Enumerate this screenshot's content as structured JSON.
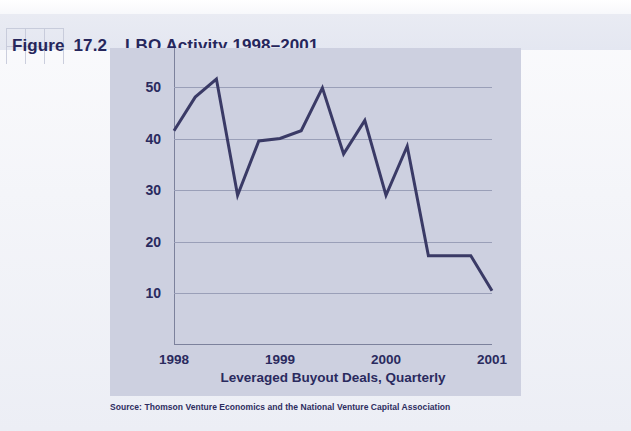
{
  "figure": {
    "label": "Figure",
    "number": "17.2",
    "title": "LBO Activity 1998–2001",
    "source_note": "Source: Thomson Venture Economics and the National Venture Capital Association"
  },
  "colors": {
    "page_background": "#f4f5f9",
    "title_band": "#e7e9f2",
    "panel_background": "#cdd0e0",
    "series_line": "#3a3a66",
    "grid_line": "#9a9fb8",
    "axis_line": "#7c819c",
    "text": "#2a2a5e"
  },
  "chart_data": {
    "type": "line",
    "title": "LBO Activity 1998–2001",
    "xlabel": "Leveraged Buyout Deals, Quarterly",
    "ylabel": "",
    "xlim": [
      0,
      15
    ],
    "ylim": [
      0,
      55
    ],
    "grid": true,
    "legend": null,
    "y_ticks": [
      10,
      20,
      30,
      40,
      50
    ],
    "y_tick_labels": [
      "10",
      "20",
      "30",
      "40",
      "50"
    ],
    "x_ticks": [
      0,
      5,
      10,
      15
    ],
    "x_tick_labels": [
      "1998",
      "1999",
      "2000",
      "2001"
    ],
    "x": [
      "1998 Q1",
      "1998 Q2",
      "1998 Q3",
      "1998 Q4",
      "1999 Q1",
      "1999 Q2",
      "1999 Q3",
      "1999 Q4",
      "2000 Q1",
      "2000 Q2",
      "2000 Q3",
      "2000 Q4",
      "2001 Q1",
      "2001 Q2",
      "2001 Q3",
      "2001 Q4"
    ],
    "series": [
      {
        "name": "Leveraged Buyout Deals, Quarterly",
        "color": "#3a3a66",
        "values": [
          41.5,
          48.0,
          51.5,
          29.0,
          39.5,
          40.0,
          41.5,
          49.8,
          37.0,
          43.5,
          29.0,
          38.5,
          17.3,
          17.3,
          17.3,
          10.5
        ]
      }
    ]
  }
}
